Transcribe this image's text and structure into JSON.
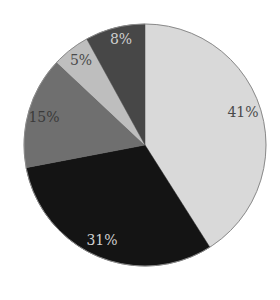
{
  "chart_data": {
    "type": "pie",
    "title": "",
    "start_angle_deg": 0,
    "direction": "clockwise",
    "center": [
      145,
      145
    ],
    "radius": 121,
    "slices": [
      {
        "label": "41%",
        "value": 41,
        "color": "#d9d9d9",
        "text_color": "#4a4a4a",
        "label_pos": [
          243,
          113
        ]
      },
      {
        "label": "31%",
        "value": 31,
        "color": "#141414",
        "text_color": "#d0d0d0",
        "label_pos": [
          102,
          241
        ]
      },
      {
        "label": "15%",
        "value": 15,
        "color": "#6f6f6f",
        "text_color": "#3a3a3a",
        "label_pos": [
          44,
          118
        ]
      },
      {
        "label": "5%",
        "value": 5,
        "color": "#bebebe",
        "text_color": "#4a4a4a",
        "label_pos": [
          81,
          61
        ]
      },
      {
        "label": "8%",
        "value": 8,
        "color": "#474747",
        "text_color": "#cfcfcf",
        "label_pos": [
          121,
          40
        ]
      }
    ],
    "categories": [
      "41%",
      "31%",
      "15%",
      "5%",
      "8%"
    ],
    "values": [
      41,
      31,
      15,
      5,
      8
    ],
    "legend": null
  }
}
